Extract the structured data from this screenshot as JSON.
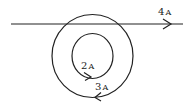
{
  "diagram": {
    "type": "current-carrying conductors",
    "stroke_color": "#222222",
    "background": "#ffffff",
    "straight_wire": {
      "current_value": "4",
      "current_unit": "A",
      "direction": "right"
    },
    "inner_loop": {
      "current_value": "2",
      "current_unit": "A",
      "direction": "counterclockwise"
    },
    "outer_loop": {
      "current_value": "3",
      "current_unit": "A",
      "direction": "clockwise"
    }
  }
}
